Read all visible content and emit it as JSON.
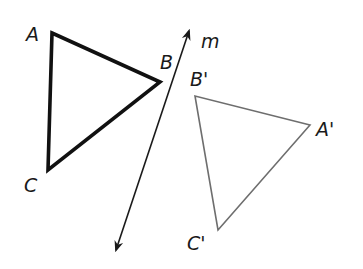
{
  "diagram": {
    "type": "reflection",
    "line": {
      "label": "m",
      "from": [
        116,
        250
      ],
      "to": [
        189,
        31
      ],
      "color": "#1a1a1a",
      "width": 1.6
    },
    "original": {
      "name": "triangle-ABC",
      "color": "#111111",
      "width": 3.6,
      "vertices": [
        {
          "label": "A",
          "x": 52,
          "y": 33,
          "lx": 26,
          "ly": 41
        },
        {
          "label": "B",
          "x": 160,
          "y": 82,
          "lx": 160,
          "ly": 69
        },
        {
          "label": "C",
          "x": 48,
          "y": 170,
          "lx": 24,
          "ly": 192
        }
      ]
    },
    "image": {
      "name": "triangle-A'B'C'",
      "color": "#6e6e6e",
      "width": 1.6,
      "vertices": [
        {
          "label": "A'",
          "x": 310,
          "y": 125,
          "lx": 316,
          "ly": 136
        },
        {
          "label": "B'",
          "x": 195,
          "y": 96,
          "lx": 190,
          "ly": 86
        },
        {
          "label": "C'",
          "x": 218,
          "y": 230,
          "lx": 187,
          "ly": 250
        }
      ]
    },
    "line_label": {
      "text": "m",
      "x": 201,
      "y": 48
    }
  }
}
